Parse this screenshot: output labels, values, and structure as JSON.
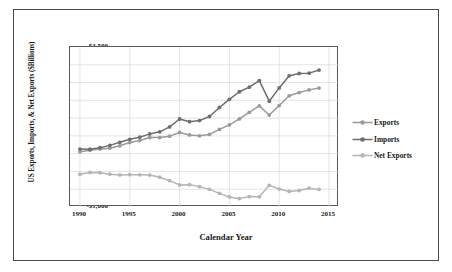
{
  "chart_data": {
    "type": "line",
    "title": "",
    "xlabel": "Calendar Year",
    "ylabel": "US Exports, Imports, & Net Exports ($Billions)",
    "xlim": [
      1989,
      2016
    ],
    "ylim": [
      -1000,
      3500
    ],
    "xticks": [
      "1990",
      "1995",
      "2000",
      "2005",
      "2010",
      "2015"
    ],
    "xtick_values": [
      1990,
      1995,
      2000,
      2005,
      2010,
      2015
    ],
    "yticks": [
      "$3,500",
      "$3,000",
      "$2,500",
      "$2,000",
      "$1,500",
      "$1,000",
      "$500",
      "$0",
      "-$500",
      "-$1,000"
    ],
    "ytick_values": [
      3500,
      3000,
      2500,
      2000,
      1500,
      1000,
      500,
      0,
      -500,
      -1000
    ],
    "grid": true,
    "grid_color": "#d9d9d9",
    "legend_position": "right",
    "x": [
      1990,
      1991,
      1992,
      1993,
      1994,
      1995,
      1996,
      1997,
      1998,
      1999,
      2000,
      2001,
      2002,
      2003,
      2004,
      2005,
      2006,
      2007,
      2008,
      2009,
      2010,
      2011,
      2012,
      2013,
      2014
    ],
    "series": [
      {
        "name": "Exports",
        "color": "#9a9a9a",
        "marker": "circle",
        "values": [
          552,
          596,
          633,
          655,
          721,
          812,
          868,
          954,
          953,
          992,
          1096,
          1027,
          1003,
          1041,
          1182,
          1309,
          1476,
          1664,
          1843,
          1587,
          1853,
          2127,
          2219,
          2294,
          2345
        ]
      },
      {
        "name": "Imports",
        "color": "#6e6e6e",
        "marker": "circle",
        "values": [
          630,
          624,
          669,
          733,
          820,
          903,
          964,
          1056,
          1115,
          1252,
          1475,
          1399,
          1430,
          1545,
          1798,
          2027,
          2241,
          2370,
          2556,
          1976,
          2349,
          2690,
          2755,
          2765,
          2852
        ]
      },
      {
        "name": "Net Exports",
        "color": "#b5b5b5",
        "marker": "circle",
        "values": [
          -78,
          -28,
          -36,
          -78,
          -99,
          -91,
          -96,
          -102,
          -162,
          -260,
          -379,
          -372,
          -427,
          -504,
          -616,
          -718,
          -765,
          -706,
          -713,
          -389,
          -496,
          -563,
          -536,
          -471,
          -507
        ]
      }
    ]
  },
  "axis": {
    "y_title": "US Exports, Imports, & Net Exports ($Billions)",
    "x_title": "Calendar Year"
  },
  "legend": {
    "items": [
      {
        "label": "Exports",
        "color": "#9a9a9a"
      },
      {
        "label": "Imports",
        "color": "#6e6e6e"
      },
      {
        "label": "Net Exports",
        "color": "#b5b5b5"
      }
    ]
  }
}
